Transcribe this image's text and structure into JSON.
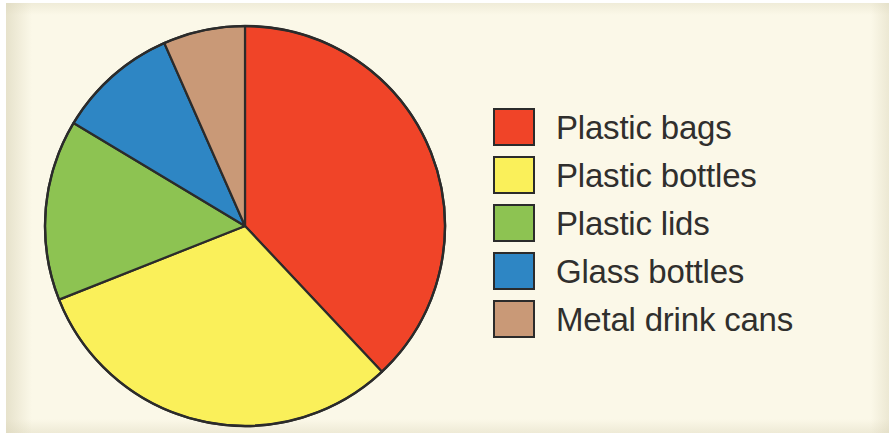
{
  "figure": {
    "background_color": "#fbf8e8",
    "outline_color": "#2b2b2b"
  },
  "legend": {
    "position": "right",
    "items": [
      {
        "label": "Plastic bags",
        "color": "#f04428"
      },
      {
        "label": "Plastic bottles",
        "color": "#faf05a"
      },
      {
        "label": "Plastic lids",
        "color": "#8dc352"
      },
      {
        "label": "Glass bottles",
        "color": "#2e86c4"
      },
      {
        "label": "Metal drink cans",
        "color": "#c99977"
      }
    ]
  },
  "chart_data": {
    "type": "pie",
    "title": "",
    "xlabel": "",
    "ylabel": "",
    "grid": false,
    "legend_position": "right",
    "start_angle_deg": 0,
    "direction": "clockwise",
    "center": {
      "x": 205,
      "y": 205
    },
    "radius": 200,
    "categories": [
      "Plastic bags",
      "Plastic bottles",
      "Plastic lids",
      "Glass bottles",
      "Metal drink cans"
    ],
    "values": [
      38,
      31,
      14.6,
      9.8,
      6.6
    ],
    "value_unit": "percent",
    "colors": [
      "#f04428",
      "#faf05a",
      "#8dc352",
      "#2e86c4",
      "#c99977"
    ],
    "slices": [
      {
        "label": "Plastic bags",
        "value": 38,
        "color": "#f04428",
        "start_deg": 0,
        "end_deg": 136.8
      },
      {
        "label": "Plastic bottles",
        "value": 31,
        "color": "#faf05a",
        "start_deg": 136.8,
        "end_deg": 248.4
      },
      {
        "label": "Plastic lids",
        "value": 14.6,
        "color": "#8dc352",
        "start_deg": 248.4,
        "end_deg": 301.0
      },
      {
        "label": "Glass bottles",
        "value": 9.8,
        "color": "#2e86c4",
        "start_deg": 301.0,
        "end_deg": 336.2
      },
      {
        "label": "Metal drink cans",
        "value": 6.6,
        "color": "#c99977",
        "start_deg": 336.2,
        "end_deg": 360
      }
    ]
  }
}
